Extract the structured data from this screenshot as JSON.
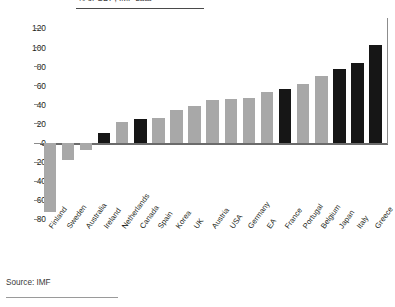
{
  "subtitle": "% of GDP; IMF data",
  "source": "Source: IMF",
  "colors": {
    "bar_gray": "#a8a8a8",
    "bar_black": "#161616",
    "axis": "#6b6b6b",
    "text": "#231f20"
  },
  "chart_data": {
    "type": "bar",
    "title": "",
    "subtitle": "% of GDP; IMF data",
    "xlabel": "",
    "ylabel": "",
    "ylim": [
      -80,
      120
    ],
    "ytick_values": [
      120,
      100,
      80,
      60,
      40,
      20,
      0,
      -20,
      -40,
      -60,
      -80
    ],
    "ytick_labels": [
      "120",
      "100",
      "80",
      "60",
      "40",
      "20",
      "0",
      "-20",
      "-40",
      "-60",
      "-80"
    ],
    "grid": false,
    "legend": "none",
    "source": "Source: IMF",
    "categories": [
      "Finland",
      "Sweden",
      "Australia",
      "Ireland",
      "Netherlands",
      "Canada",
      "Spain",
      "Korea",
      "UK",
      "Austria",
      "USA",
      "Germany",
      "EA",
      "France",
      "Portugal",
      "Belgium",
      "Japan",
      "Italy",
      "Greece"
    ],
    "values": [
      -72,
      -18,
      -7,
      10,
      22,
      25,
      26,
      35,
      39,
      45,
      46,
      47,
      53,
      57,
      62,
      70,
      77,
      84,
      103
    ],
    "highlight": [
      false,
      false,
      false,
      true,
      false,
      true,
      false,
      false,
      false,
      false,
      false,
      false,
      false,
      true,
      false,
      false,
      true,
      true,
      true
    ],
    "highlight_meaning": "black bars"
  }
}
